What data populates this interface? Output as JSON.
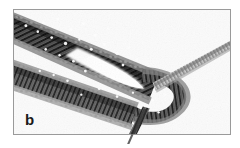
{
  "figure": {
    "panel_label": "b",
    "alt_description": "Electron micrograph of a long cross-striated filament bundle folded into a hairpin loop, with a thinner filament branching toward the upper right and a tail exiting at the bottom",
    "modality": "transmission electron micrograph",
    "color_mode": "grayscale"
  },
  "frame": {
    "border_color": "#9a9a9a",
    "background_color": "#fdfdfd",
    "outer_background": "#ffffff",
    "left": 13,
    "top": 9,
    "width": 218,
    "height": 126
  },
  "palette": {
    "filament_dark": "#141414",
    "filament_mid": "#555555",
    "filament_light": "#b4b4b4",
    "speckle_highlight": "#ffffff",
    "background": "#fbfbfb",
    "label_color": "#1a1a1a"
  },
  "structures": [
    {
      "name": "upper-filament-arm",
      "description": "thick dark striated bundle entering at upper-left and running down-right",
      "start": [
        14,
        14
      ],
      "end": [
        150,
        78
      ],
      "thickness": 30,
      "tone": "dark"
    },
    {
      "name": "hairpin-loop",
      "description": "tight U-turn of the bundle at mid-right enclosing a bright lens-shaped gap",
      "apex": [
        160,
        88
      ],
      "tone": "dark"
    },
    {
      "name": "lower-filament-arm",
      "description": "returning arm of the bundle running back toward the lower-left",
      "start": [
        150,
        110
      ],
      "end": [
        20,
        60
      ],
      "thickness": 26,
      "tone": "mid"
    },
    {
      "name": "branch-filament",
      "description": "thin pale striated filament extending from the loop to the upper-right edge",
      "start": [
        150,
        80
      ],
      "end": [
        222,
        40
      ],
      "thickness": 9,
      "tone": "light"
    },
    {
      "name": "tail-filament",
      "description": "narrow filament descending from the loop base past the bottom frame edge",
      "start": [
        140,
        108
      ],
      "end": [
        129,
        146
      ],
      "thickness": 7,
      "tone": "mid"
    },
    {
      "name": "interior-gap",
      "description": "bright background wedge enclosed by the hairpin loop",
      "center": [
        128,
        75
      ],
      "tone": "background"
    }
  ]
}
